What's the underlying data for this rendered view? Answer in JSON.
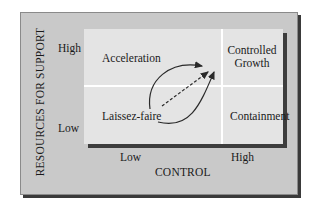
{
  "diagram": {
    "y_axis": {
      "title": "RESOURCES FOR SUPPORT",
      "high_label": "High",
      "low_label": "Low"
    },
    "x_axis": {
      "title": "CONTROL",
      "low_label": "Low",
      "high_label": "High"
    },
    "quadrants": {
      "top_left": "Acceleration",
      "top_right_line1": "Controlled",
      "top_right_line2": "Growth",
      "bottom_left": "Laissez-faire",
      "bottom_right": "Containment"
    },
    "arrows": [
      {
        "from": "Laissez-faire",
        "to": "Controlled Growth",
        "via": "Acceleration",
        "style": "solid-curve"
      },
      {
        "from": "Laissez-faire",
        "to": "Controlled Growth",
        "via": "direct",
        "style": "dashed"
      },
      {
        "from": "Laissez-faire",
        "to": "Controlled Growth",
        "via": "Containment",
        "style": "solid-curve"
      }
    ],
    "colors": {
      "outer_panel": "#c9c9c9",
      "inner_panel": "#e4e4e4",
      "shadow": "#3d3d3d",
      "divider": "#ffffff"
    }
  }
}
